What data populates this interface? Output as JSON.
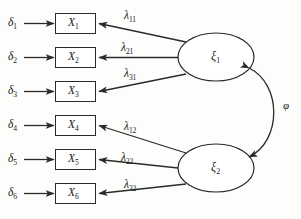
{
  "diagram": {
    "type": "sem-path-diagram",
    "canvas": {
      "width": 301,
      "height": 219
    },
    "stroke_color": "#2a2a2a",
    "background_color": "#fdfdfc",
    "errors": [
      {
        "id": "d1",
        "label": "δ",
        "sub": "1",
        "x": 8,
        "y": 17
      },
      {
        "id": "d2",
        "label": "δ",
        "sub": "2",
        "x": 8,
        "y": 51
      },
      {
        "id": "d3",
        "label": "δ",
        "sub": "3",
        "x": 8,
        "y": 85
      },
      {
        "id": "d4",
        "label": "δ",
        "sub": "4",
        "x": 8,
        "y": 119
      },
      {
        "id": "d5",
        "label": "δ",
        "sub": "5",
        "x": 8,
        "y": 153
      },
      {
        "id": "d6",
        "label": "δ",
        "sub": "6",
        "x": 8,
        "y": 187
      }
    ],
    "indicators": [
      {
        "id": "x1",
        "label": "X",
        "sub": "1",
        "x": 55,
        "y": 13,
        "w": 41,
        "h": 21
      },
      {
        "id": "x2",
        "label": "X",
        "sub": "2",
        "x": 55,
        "y": 47,
        "w": 41,
        "h": 21
      },
      {
        "id": "x3",
        "label": "X",
        "sub": "3",
        "x": 55,
        "y": 81,
        "w": 41,
        "h": 21
      },
      {
        "id": "x4",
        "label": "X",
        "sub": "4",
        "x": 55,
        "y": 115,
        "w": 41,
        "h": 21
      },
      {
        "id": "x5",
        "label": "X",
        "sub": "5",
        "x": 55,
        "y": 149,
        "w": 41,
        "h": 21
      },
      {
        "id": "x6",
        "label": "X",
        "sub": "6",
        "x": 55,
        "y": 183,
        "w": 41,
        "h": 21
      }
    ],
    "factors": [
      {
        "id": "xi1",
        "label": "ξ",
        "sub": "1",
        "cx": 216,
        "cy": 57,
        "rx": 38,
        "ry": 24
      },
      {
        "id": "xi2",
        "label": "ξ",
        "sub": "2",
        "cx": 216,
        "cy": 168,
        "rx": 38,
        "ry": 24
      }
    ],
    "loadings": [
      {
        "id": "l11",
        "label": "λ",
        "sub": "11",
        "x": 124,
        "y": 10,
        "from": "xi1",
        "to": "x1"
      },
      {
        "id": "l21",
        "label": "λ",
        "sub": "21",
        "x": 121,
        "y": 42,
        "from": "xi1",
        "to": "x2"
      },
      {
        "id": "l31",
        "label": "λ",
        "sub": "31",
        "x": 124,
        "y": 68,
        "from": "xi1",
        "to": "x3"
      },
      {
        "id": "l12",
        "label": "λ",
        "sub": "12",
        "x": 124,
        "y": 121,
        "from": "xi2",
        "to": "x4"
      },
      {
        "id": "l22",
        "label": "λ",
        "sub": "22",
        "x": 121,
        "y": 152,
        "from": "xi2",
        "to": "x5"
      },
      {
        "id": "l32",
        "label": "λ",
        "sub": "32",
        "x": 124,
        "y": 179,
        "from": "xi2",
        "to": "x6"
      }
    ],
    "covariance": {
      "id": "phi",
      "label": "φ",
      "x": 283,
      "y": 100,
      "between": [
        "xi1",
        "xi2"
      ],
      "double_headed": true
    }
  }
}
